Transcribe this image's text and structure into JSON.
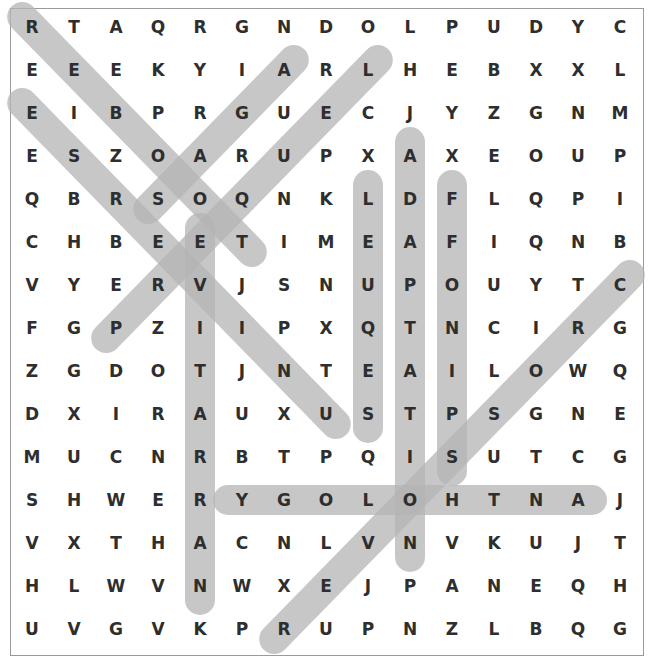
{
  "puzzle": {
    "grid": [
      "RTAQRGNDOLPUDYC",
      "EEEKYIARLHEBXXL",
      "EIBPRGUECJYZGNM",
      "ESZOARUPXAXEOUP",
      "QBRSOQNKLDFLQPI",
      "CHBEETIMEAFIQNB",
      "VYERVJSNUPOUYTC",
      "FGPZIIPXQTNCIRG",
      "ZGDOTJNTEAILOWQ",
      "DXIRAUXUSTPSGNE",
      "MUCNRBTPQISUTCG",
      "SHWERYGOLOHTNAJ",
      "VXTHACNLVNVKUJT",
      "HLWVNWXEJPANEQH",
      "UVGVKPRUPNZLBQG"
    ],
    "found_words": [
      {
        "word": "REBOOT",
        "start": [
          0,
          0
        ],
        "end": [
          5,
          5
        ]
      },
      {
        "word": "UNIVERSE",
        "start": [
          9,
          7
        ],
        "end": [
          2,
          0
        ]
      },
      {
        "word": "SAGA",
        "start": [
          4,
          3
        ],
        "end": [
          1,
          6
        ]
      },
      {
        "word": "PREQUEL",
        "start": [
          7,
          2
        ],
        "end": [
          1,
          8
        ]
      },
      {
        "word": "NARRATIVE",
        "start": [
          13,
          4
        ],
        "end": [
          5,
          4
        ]
      },
      {
        "word": "SEQUEL",
        "start": [
          9,
          8
        ],
        "end": [
          4,
          8
        ]
      },
      {
        "word": "ADAPTATION",
        "start": [
          3,
          9
        ],
        "end": [
          12,
          9
        ]
      },
      {
        "word": "SPINOFF",
        "start": [
          10,
          10
        ],
        "end": [
          4,
          10
        ]
      },
      {
        "word": "ANTHOLOGY",
        "start": [
          11,
          13
        ],
        "end": [
          11,
          5
        ]
      },
      {
        "word": "CROSSOVER",
        "start": [
          6,
          14
        ],
        "end": [
          14,
          6
        ]
      }
    ],
    "highlight_color": "#b4b4b4"
  }
}
